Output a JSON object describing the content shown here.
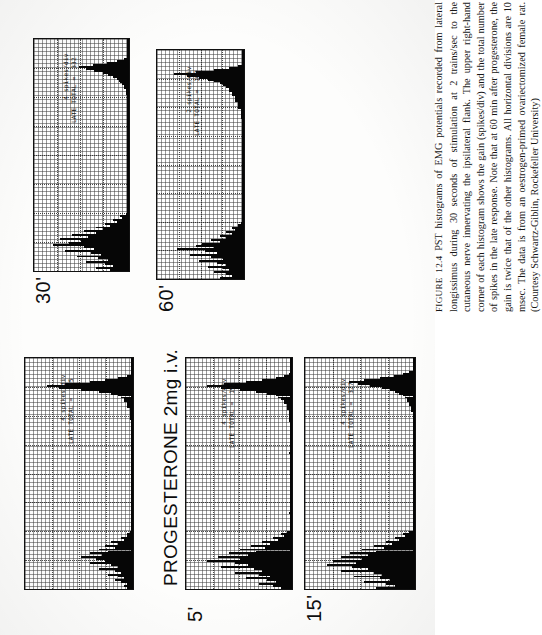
{
  "figure": {
    "label": "FIGURE 12.4",
    "title": "PROGESTERONE 2mg i.v.",
    "caption": "PST histograms of EMG potentials recorded from lateral longissimus during 30 seconds of stimulation at 2 trains/sec to the cutaneous nerve innervating the ipsilateral flank. The upper right-hand corner of each histogram shows the gain (spikes/div) and the total number of spikes in the late response. Note that at 60 min after progesterone, the gain is twice that of the other histograms. All horizontal divisions are 10 msec. The data is from an oestrogen-primed ovariectomized female rat. (Courtesy Schwartz-Giblin, Rockefeller University)"
  },
  "chart_data": {
    "type": "bar",
    "title": "PROGESTERONE 2mg i.v.",
    "xlabel": "Time (msec)",
    "ylabel": "Spikes per division",
    "x_division_msec": 10,
    "grid": true,
    "legend": "none",
    "panels": [
      {
        "id": "control",
        "time_label": "",
        "gain_label": "4 spikes/div",
        "total_label": "LATE TOTAL =   95",
        "gain_spikes_per_div": 4,
        "late_total": 95,
        "early_peak_bin": 14,
        "values": [
          0,
          0,
          0,
          0,
          0,
          0,
          0,
          0,
          0,
          2,
          5,
          9,
          14,
          22,
          28,
          24,
          17,
          11,
          7,
          5,
          4,
          3,
          3,
          2,
          2,
          2,
          1,
          1,
          1,
          1,
          1,
          1,
          0,
          0,
          0,
          0,
          0,
          0,
          0,
          0,
          0,
          0,
          0,
          0,
          0,
          0,
          0,
          0,
          0,
          0,
          0,
          0,
          0,
          0,
          0,
          0,
          0,
          0,
          0,
          0,
          0,
          0,
          0,
          0,
          0,
          0,
          0,
          0,
          0,
          0,
          0,
          0,
          0,
          0,
          0,
          0,
          0,
          0,
          0,
          0,
          0,
          0,
          0,
          0,
          0,
          0,
          0,
          0,
          0,
          0,
          1,
          2,
          2,
          4,
          3,
          7,
          5,
          9,
          6,
          11,
          8,
          14,
          10,
          17,
          12,
          9,
          14,
          7,
          5,
          11,
          6,
          4,
          8,
          5,
          3,
          6,
          4,
          2,
          3,
          2
        ]
      },
      {
        "id": "5min",
        "time_label": "5'",
        "gain_label": "4 spikes/div",
        "total_label": "LATE TOTAL =  192",
        "gain_spikes_per_div": 4,
        "late_total": 192,
        "early_peak_bin": 14,
        "values": [
          0,
          0,
          0,
          0,
          0,
          0,
          0,
          0,
          1,
          3,
          6,
          11,
          17,
          25,
          31,
          26,
          19,
          13,
          9,
          6,
          5,
          4,
          3,
          3,
          2,
          2,
          2,
          1,
          1,
          1,
          1,
          1,
          1,
          0,
          0,
          0,
          0,
          0,
          0,
          0,
          0,
          0,
          0,
          0,
          0,
          0,
          0,
          0,
          0,
          1,
          0,
          0,
          0,
          0,
          0,
          0,
          0,
          0,
          0,
          0,
          0,
          0,
          0,
          0,
          0,
          0,
          0,
          0,
          0,
          0,
          0,
          0,
          0,
          0,
          0,
          0,
          0,
          0,
          0,
          0,
          1,
          0,
          0,
          0,
          0,
          0,
          0,
          0,
          0,
          0,
          2,
          4,
          3,
          7,
          5,
          11,
          8,
          15,
          10,
          19,
          13,
          23,
          16,
          27,
          19,
          31,
          21,
          16,
          26,
          14,
          11,
          21,
          12,
          8,
          17,
          9,
          6,
          12,
          7,
          4
        ]
      },
      {
        "id": "15min",
        "time_label": "15'",
        "gain_label": "4 spikes/div",
        "total_label": "LATE TOTAL =  327",
        "gain_spikes_per_div": 4,
        "late_total": 327,
        "early_peak_bin": 15,
        "values": [
          0,
          0,
          0,
          0,
          0,
          0,
          1,
          3,
          6,
          11,
          18,
          26,
          34,
          29,
          23,
          17,
          13,
          10,
          8,
          6,
          5,
          4,
          4,
          3,
          3,
          2,
          2,
          2,
          1,
          1,
          1,
          1,
          1,
          1,
          0,
          0,
          0,
          0,
          0,
          0,
          0,
          0,
          0,
          0,
          0,
          0,
          0,
          0,
          0,
          0,
          0,
          1,
          0,
          0,
          0,
          0,
          0,
          0,
          0,
          0,
          0,
          0,
          0,
          0,
          0,
          0,
          0,
          0,
          0,
          0,
          0,
          0,
          0,
          0,
          0,
          0,
          0,
          0,
          0,
          0,
          0,
          0,
          0,
          0,
          0,
          0,
          0,
          0,
          0,
          0,
          3,
          6,
          5,
          10,
          8,
          15,
          12,
          21,
          16,
          27,
          20,
          33,
          24,
          38,
          27,
          42,
          30,
          45,
          32,
          24,
          38,
          21,
          17,
          31,
          18,
          13,
          26,
          15,
          10,
          20
        ]
      },
      {
        "id": "30min",
        "time_label": "30'",
        "gain_label": "4 spikes/div",
        "total_label": "LATE TOTAL =  332",
        "gain_spikes_per_div": 4,
        "late_total": 332,
        "early_peak_bin": 13,
        "values": [
          0,
          0,
          0,
          0,
          0,
          0,
          0,
          0,
          0,
          1,
          3,
          7,
          13,
          21,
          29,
          25,
          20,
          15,
          12,
          9,
          7,
          6,
          5,
          4,
          3,
          3,
          2,
          2,
          2,
          1,
          1,
          1,
          1,
          0,
          0,
          0,
          0,
          0,
          0,
          0,
          0,
          0,
          0,
          0,
          0,
          0,
          0,
          0,
          0,
          0,
          0,
          0,
          0,
          0,
          0,
          0,
          0,
          0,
          0,
          0,
          0,
          0,
          0,
          0,
          0,
          0,
          0,
          0,
          0,
          0,
          0,
          0,
          0,
          0,
          0,
          0,
          0,
          0,
          0,
          0,
          0,
          0,
          0,
          0,
          0,
          0,
          0,
          0,
          0,
          0,
          2,
          5,
          4,
          9,
          7,
          14,
          11,
          19,
          15,
          26,
          19,
          33,
          24,
          40,
          28,
          35,
          44,
          26,
          20,
          37,
          22,
          16,
          30,
          18,
          12,
          25,
          14,
          9,
          19,
          11
        ]
      },
      {
        "id": "60min",
        "time_label": "60'",
        "gain_label": "2 spikes/div",
        "total_label": "LATE TOTAL =  109",
        "gain_spikes_per_div": 2,
        "late_total": 109,
        "early_peak_bin": 12,
        "values": [
          0,
          0,
          0,
          0,
          0,
          0,
          0,
          0,
          2,
          5,
          10,
          16,
          23,
          19,
          15,
          12,
          10,
          8,
          7,
          6,
          5,
          5,
          4,
          4,
          3,
          3,
          3,
          2,
          2,
          2,
          2,
          1,
          1,
          1,
          1,
          1,
          0,
          0,
          0,
          0,
          0,
          0,
          0,
          0,
          0,
          0,
          0,
          0,
          0,
          0,
          0,
          0,
          0,
          0,
          0,
          0,
          0,
          0,
          0,
          0,
          0,
          0,
          0,
          0,
          0,
          0,
          0,
          0,
          0,
          0,
          0,
          0,
          0,
          0,
          0,
          0,
          0,
          0,
          0,
          0,
          0,
          0,
          0,
          0,
          0,
          0,
          0,
          0,
          0,
          0,
          1,
          2,
          2,
          4,
          3,
          6,
          4,
          8,
          6,
          11,
          8,
          14,
          16,
          10,
          22,
          13,
          9,
          18,
          11,
          7,
          15,
          9,
          6,
          12,
          7,
          5,
          10,
          6,
          4,
          8
        ]
      }
    ]
  }
}
